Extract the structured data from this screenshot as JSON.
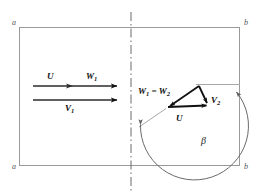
{
  "figure": {
    "background_color": "#ffffff",
    "frame": {
      "stroke_color": "#9a9a9a",
      "corner_labels": {
        "top_left": "a",
        "top_right": "b",
        "bottom_left": "a",
        "bottom_right": "b"
      }
    },
    "centerline": {
      "style": "dash-dot",
      "color": "#666666"
    },
    "left_side": {
      "upstream_arrows": [
        {
          "name": "upper-arrow",
          "labels": [
            {
              "text": "U",
              "sub": ""
            },
            {
              "text": "W",
              "sub": "1"
            }
          ]
        },
        {
          "name": "lower-arrow",
          "labels": [
            {
              "text": "V",
              "sub": "1"
            }
          ]
        }
      ],
      "label_U": "U",
      "label_W1_base": "W",
      "label_W1_sub": "1",
      "label_V1_base": "V",
      "label_V1_sub": "1"
    },
    "right_side": {
      "triangle": {
        "name": "velocity-triangle",
        "vertices": {
          "apex": [
            199,
            86
          ],
          "bottom_left": [
            168,
            107
          ],
          "bottom_right": [
            208,
            105
          ]
        },
        "edges": [
          {
            "name": "W-vector",
            "label_base": "W",
            "label_sub": "1",
            "label_eq": " = ",
            "label_base2": "W",
            "label_sub2": "2"
          },
          {
            "name": "V2-vector",
            "label_base": "V",
            "label_sub": "2"
          },
          {
            "name": "U-vector",
            "label_base": "U",
            "label_sub": ""
          }
        ],
        "stroke_color": "#000000"
      },
      "label_W1W2_pre": "W",
      "label_W1W2_sub1": "1",
      "label_W1W2_eq": " = ",
      "label_W1W2_post": "W",
      "label_W1W2_sub2": "2",
      "label_V2_base": "V",
      "label_V2_sub": "2",
      "label_U": "U",
      "angle": {
        "name": "beta-angle-arc",
        "symbol": "β",
        "arc_color": "#6a6a6a",
        "reference_line_color": "#a8a8a8"
      }
    }
  }
}
